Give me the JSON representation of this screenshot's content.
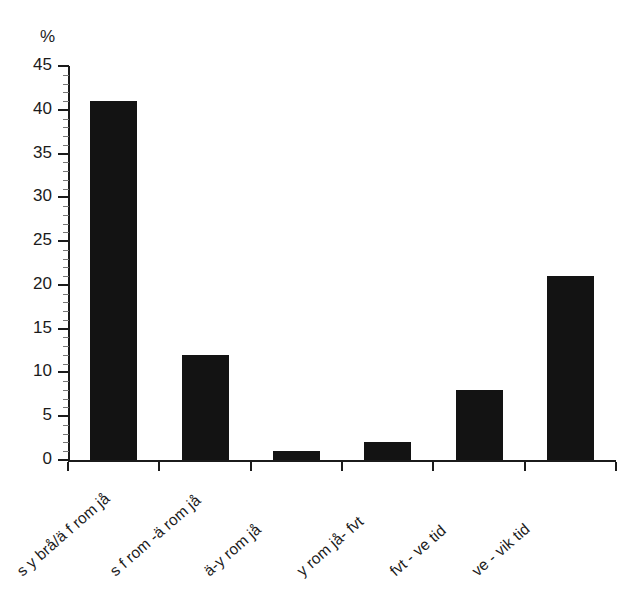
{
  "chart_data": {
    "type": "bar",
    "title": "",
    "subtitle": "",
    "xlabel": "",
    "ylabel": "%",
    "ylim": [
      0,
      45
    ],
    "y_ticks": [
      0,
      5,
      10,
      15,
      20,
      25,
      30,
      35,
      40,
      45
    ],
    "grid": false,
    "legend": false,
    "legend_position": "none",
    "bar_color": "#131313",
    "axis_color": "#1b1b1b",
    "background": "#ffffff",
    "categories": [
      "s y brå/ä f rom jå",
      "s f rom -ä rom jå",
      "ä-y rom jå",
      "y rom jå- fvt",
      "fvt - ve tid",
      "ve - vik tid"
    ],
    "values": [
      41,
      12,
      1,
      2,
      8,
      21
    ],
    "annotations": []
  },
  "axis": {
    "unit_label": "%",
    "tick_labels": [
      "0",
      "5",
      "10",
      "15",
      "20",
      "25",
      "30",
      "35",
      "40",
      "45"
    ]
  }
}
